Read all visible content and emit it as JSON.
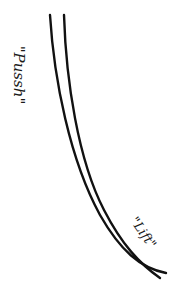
{
  "diagram": {
    "labels": {
      "push": "\"Pussh\"",
      "lift": "\"Lift\""
    },
    "stroke_color": "#111111",
    "background": "#ffffff",
    "curves": [
      {
        "name": "outer-curve",
        "start": [
          50,
          15
        ],
        "end": [
          166,
          273
        ]
      },
      {
        "name": "inner-curve",
        "start": [
          64,
          15
        ],
        "end": [
          160,
          278
        ]
      }
    ]
  }
}
